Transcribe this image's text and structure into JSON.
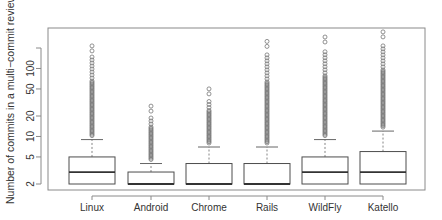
{
  "chart_data": {
    "type": "boxplot",
    "title": "",
    "xlabel": "",
    "ylabel": "Number of commits in a multi−commit review (log)",
    "yscale": "log",
    "ylim": [
      1.9,
      400
    ],
    "y_ticks": [
      {
        "value": 2,
        "label": "2"
      },
      {
        "value": 5,
        "label": "5"
      },
      {
        "value": 10,
        "label": "10"
      },
      {
        "value": 20,
        "label": "20"
      },
      {
        "value": 50,
        "label": "50"
      },
      {
        "value": 100,
        "label": "100"
      },
      {
        "value": 200,
        "label": ""
      }
    ],
    "categories": [
      "Linux",
      "Android",
      "Chrome",
      "Rails",
      "WildFly",
      "Katello"
    ],
    "series": [
      {
        "name": "Linux",
        "min": 2,
        "q1": 2,
        "median": 3,
        "q3": 5,
        "whisker_high": 9,
        "outlier_max": 215
      },
      {
        "name": "Android",
        "min": 2,
        "q1": 2,
        "median": 2,
        "q3": 3,
        "whisker_high": 4,
        "outlier_max": 28
      },
      {
        "name": "Chrome",
        "min": 2,
        "q1": 2,
        "median": 2,
        "q3": 4,
        "whisker_high": 7,
        "outlier_max": 50
      },
      {
        "name": "Rails",
        "min": 2,
        "q1": 2,
        "median": 2,
        "q3": 4,
        "whisker_high": 7,
        "outlier_max": 250
      },
      {
        "name": "WildFly",
        "min": 2,
        "q1": 2,
        "median": 3,
        "q3": 5,
        "whisker_high": 9,
        "outlier_max": 290
      },
      {
        "name": "Katello",
        "min": 2,
        "q1": 2,
        "median": 3,
        "q3": 6,
        "whisker_high": 12,
        "outlier_max": 345
      }
    ],
    "grid": false,
    "legend": null,
    "colors": {
      "box": "#4d4d4d",
      "median": "#333333",
      "whisker": "#666666",
      "outlier": "#777777",
      "frame": "#8a8a8a"
    }
  }
}
